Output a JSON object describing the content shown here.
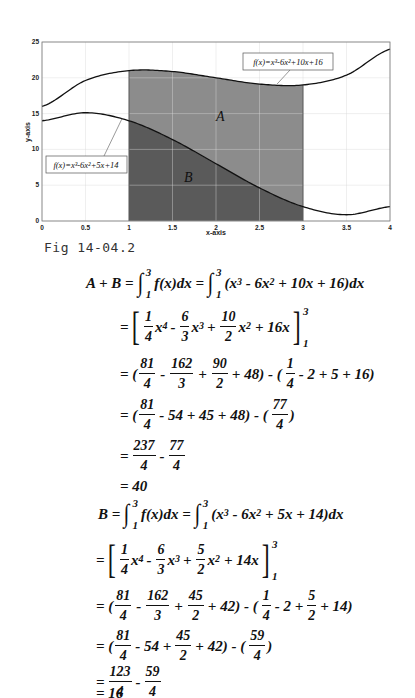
{
  "figure": {
    "caption": "Fig 14-04.2"
  },
  "chart_data": {
    "type": "line",
    "title": "",
    "xlabel": "x-axis",
    "ylabel": "y-axis",
    "xlim": [
      0,
      4
    ],
    "ylim": [
      0,
      25
    ],
    "grid": true,
    "x_ticks": [
      "0",
      "0.5",
      "1",
      "1.5",
      "2",
      "2.5",
      "3",
      "3.5",
      "4"
    ],
    "y_ticks": [
      "0",
      "5",
      "10",
      "15",
      "20",
      "25"
    ],
    "series": [
      {
        "name": "f(x)=x^3-6x^2+10x+16",
        "label": "f(x)=x³-6x²+10x+16",
        "x": [
          0,
          0.5,
          1,
          1.5,
          2,
          2.5,
          3,
          3.5,
          4
        ],
        "values": [
          16,
          19.625,
          21,
          20.875,
          20,
          19.125,
          19,
          20.375,
          24
        ]
      },
      {
        "name": "f(x)=x^3-6x^2+5x+14",
        "label": "f(x)=x³-6x²+5x+14",
        "x": [
          0,
          0.5,
          1,
          1.5,
          2,
          2.5,
          3,
          3.5,
          4
        ],
        "values": [
          14,
          15.125,
          14,
          11.375,
          8,
          4.625,
          2,
          0.875,
          2
        ]
      }
    ],
    "shaded_regions": [
      {
        "label": "A",
        "from_x": 1,
        "to_x": 3,
        "between": "upper and lower curves",
        "color": "#8c8c8c"
      },
      {
        "label": "B",
        "from_x": 1,
        "to_x": 3,
        "between": "lower curve and x-axis",
        "color": "#5a5a5a"
      }
    ],
    "annotations": [
      {
        "text": "f(x)=x³-6x²+10x+16",
        "arrow_to": [
          2.7,
          19.1
        ]
      },
      {
        "text": "f(x)=x³-6x²+5x+14",
        "arrow_to": [
          0.92,
          14.3
        ]
      },
      {
        "text": "A",
        "at": [
          2.05,
          14.5
        ]
      },
      {
        "text": "B",
        "at": [
          1.68,
          6
        ]
      }
    ]
  },
  "derivation_AB": {
    "line1": {
      "lhs": "A + B =",
      "int_lower": "1",
      "int_upper": "3",
      "integrand1": "f(x)dx =",
      "integrand2a": "(x",
      "e3": "3",
      "integrand2b": " - 6x",
      "e2": "2",
      "integrand2c": " + 10x + 16)dx"
    },
    "line2": {
      "eq": "=",
      "t1n": "1",
      "t1d": "4",
      "t1v": "x",
      "t1e": "4",
      "op1": "-",
      "t2n": "6",
      "t2d": "3",
      "t2v": "x",
      "t2e": "3",
      "op2": "+",
      "t3n": "10",
      "t3d": "2",
      "t3v": "x",
      "t3e": "2",
      "tail": "+ 16x",
      "upper": "3",
      "lower": "1"
    },
    "line3": {
      "eq": "= (",
      "f1n": "81",
      "f1d": "4",
      "op1": "-",
      "f2n": "162",
      "f2d": "3",
      "op2": "+",
      "f3n": "90",
      "f3d": "2",
      "mid": "+ 48) - (",
      "f4n": "1",
      "f4d": "4",
      "tail": "- 2 + 5 + 16)"
    },
    "line4": {
      "eq": "= (",
      "f1n": "81",
      "f1d": "4",
      "mid": "- 54 + 45 + 48) - (",
      "f2n": "77",
      "f2d": "4",
      "tail": ")"
    },
    "line5": {
      "eq": "=",
      "f1n": "237",
      "f1d": "4",
      "op": "-",
      "f2n": "77",
      "f2d": "4"
    },
    "line6": {
      "text": "= 40"
    }
  },
  "derivation_B": {
    "line1": {
      "lhs": "B =",
      "int_lower": "1",
      "int_upper": "3",
      "integrand1": "f(x)dx =",
      "integrand2a": "(x",
      "e3": "3",
      "integrand2b": " - 6x",
      "e2": "2",
      "integrand2c": " + 5x + 14)dx"
    },
    "line2": {
      "eq": "=",
      "t1n": "1",
      "t1d": "4",
      "t1v": "x",
      "t1e": "4",
      "op1": "-",
      "t2n": "6",
      "t2d": "3",
      "t2v": "x",
      "t2e": "3",
      "op2": "+",
      "t3n": "5",
      "t3d": "2",
      "t3v": "x",
      "t3e": "2",
      "tail": "+ 14x",
      "upper": "3",
      "lower": "1"
    },
    "line3": {
      "eq": "= (",
      "f1n": "81",
      "f1d": "4",
      "op1": "-",
      "f2n": "162",
      "f2d": "3",
      "op2": "+",
      "f3n": "45",
      "f3d": "2",
      "mid": "+ 42) - (",
      "f4n": "1",
      "f4d": "4",
      "mid2": "- 2 +",
      "f5n": "5",
      "f5d": "2",
      "tail": "+ 14)"
    },
    "line4": {
      "eq": "= (",
      "f1n": "81",
      "f1d": "4",
      "mid": "- 54 +",
      "f2n": "45",
      "f2d": "2",
      "mid2": "+ 42) - (",
      "f3n": "59",
      "f3d": "4",
      "tail": ")"
    },
    "line5": {
      "eq": "=",
      "f1n": "123",
      "f1d": "4",
      "op": "-",
      "f2n": "59",
      "f2d": "4"
    },
    "line6": {
      "text": "= 16"
    }
  },
  "colors": {
    "region_A": "#8c8c8c",
    "region_B": "#5a5a5a",
    "curve": "#111111",
    "grid": "#d9d9d9"
  }
}
